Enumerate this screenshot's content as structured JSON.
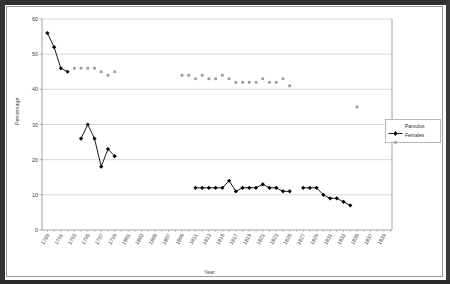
{
  "chart_data": {
    "type": "line",
    "title": "",
    "xlabel": "Year",
    "ylabel": "Percentage",
    "ylim": [
      0,
      60
    ],
    "yticks": [
      0,
      10,
      20,
      30,
      40,
      50,
      60
    ],
    "grid": true,
    "legend_position": "right",
    "x": [
      1789,
      1791,
      1793,
      1795,
      1797,
      1799,
      1801,
      1803,
      1805,
      1807,
      1809,
      1811,
      1813,
      1815,
      1817,
      1819,
      1821,
      1823,
      1825,
      1827,
      1829,
      1831,
      1833,
      1835,
      1837,
      1839
    ],
    "categories": [
      "1789",
      "1791",
      "1793",
      "1795",
      "1797",
      "1799",
      "1801",
      "1803",
      "1805",
      "1807",
      "1809",
      "1811",
      "1813",
      "1815",
      "1817",
      "1819",
      "1821",
      "1823",
      "1825",
      "1827",
      "1829",
      "1831",
      "1833",
      "1835",
      "1837",
      "1839"
    ],
    "xtick_labels": [
      "1789",
      "1791",
      "1793",
      "1795",
      "1797",
      "1799",
      "1801",
      "1803",
      "1805",
      "1807",
      "1809",
      "1811",
      "1813",
      "1815",
      "1817",
      "1819",
      "1821",
      "1823",
      "1825",
      "1827",
      "1829",
      "1831",
      "1833",
      "1835",
      "1837",
      "1839"
    ],
    "series": [
      {
        "name": "Parvulos",
        "color": "#000000",
        "marker": "diamond",
        "line": "solid",
        "points": [
          {
            "x": 1789,
            "y": 56
          },
          {
            "x": 1790,
            "y": 52
          },
          {
            "x": 1791,
            "y": 46
          },
          {
            "x": 1792,
            "y": 45
          },
          {
            "x": 1794,
            "y": 26
          },
          {
            "x": 1795,
            "y": 30
          },
          {
            "x": 1796,
            "y": 26
          },
          {
            "x": 1797,
            "y": 18
          },
          {
            "x": 1798,
            "y": 23
          },
          {
            "x": 1799,
            "y": 21
          },
          {
            "x": 1811,
            "y": 12
          },
          {
            "x": 1812,
            "y": 12
          },
          {
            "x": 1813,
            "y": 12
          },
          {
            "x": 1814,
            "y": 12
          },
          {
            "x": 1815,
            "y": 12
          },
          {
            "x": 1816,
            "y": 14
          },
          {
            "x": 1817,
            "y": 11
          },
          {
            "x": 1818,
            "y": 12
          },
          {
            "x": 1819,
            "y": 12
          },
          {
            "x": 1820,
            "y": 12
          },
          {
            "x": 1821,
            "y": 13
          },
          {
            "x": 1822,
            "y": 12
          },
          {
            "x": 1823,
            "y": 12
          },
          {
            "x": 1824,
            "y": 11
          },
          {
            "x": 1825,
            "y": 11
          },
          {
            "x": 1827,
            "y": 12
          },
          {
            "x": 1828,
            "y": 12
          },
          {
            "x": 1829,
            "y": 12
          },
          {
            "x": 1830,
            "y": 10
          },
          {
            "x": 1831,
            "y": 9
          },
          {
            "x": 1832,
            "y": 9
          },
          {
            "x": 1833,
            "y": 8
          },
          {
            "x": 1834,
            "y": 7
          }
        ]
      },
      {
        "name": "Females",
        "color": "#9a9a9a",
        "marker": "square",
        "line": "none",
        "points": [
          {
            "x": 1793,
            "y": 46
          },
          {
            "x": 1794,
            "y": 46
          },
          {
            "x": 1795,
            "y": 46
          },
          {
            "x": 1796,
            "y": 46
          },
          {
            "x": 1797,
            "y": 45
          },
          {
            "x": 1798,
            "y": 44
          },
          {
            "x": 1799,
            "y": 45
          },
          {
            "x": 1809,
            "y": 44
          },
          {
            "x": 1810,
            "y": 44
          },
          {
            "x": 1811,
            "y": 43
          },
          {
            "x": 1812,
            "y": 44
          },
          {
            "x": 1813,
            "y": 43
          },
          {
            "x": 1814,
            "y": 43
          },
          {
            "x": 1815,
            "y": 44
          },
          {
            "x": 1816,
            "y": 43
          },
          {
            "x": 1817,
            "y": 42
          },
          {
            "x": 1818,
            "y": 42
          },
          {
            "x": 1819,
            "y": 42
          },
          {
            "x": 1820,
            "y": 42
          },
          {
            "x": 1821,
            "y": 43
          },
          {
            "x": 1822,
            "y": 42
          },
          {
            "x": 1823,
            "y": 42
          },
          {
            "x": 1824,
            "y": 43
          },
          {
            "x": 1825,
            "y": 41
          },
          {
            "x": 1835,
            "y": 35
          }
        ]
      }
    ]
  },
  "legend": {
    "items": [
      {
        "label": "Parvulos",
        "color": "#000000",
        "marker": "diamond"
      },
      {
        "label": "Females",
        "color": "#9a9a9a",
        "marker": "square"
      }
    ]
  },
  "axes": {
    "y_title": "Percentage",
    "x_title": "Year"
  }
}
